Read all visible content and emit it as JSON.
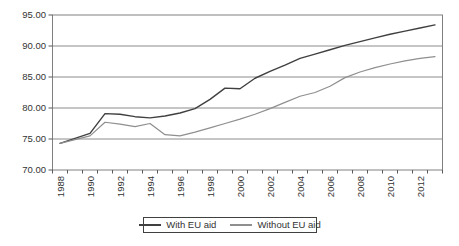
{
  "chart_data": {
    "type": "line",
    "title": "",
    "xlabel": "",
    "ylabel": "",
    "x": [
      1988,
      1989,
      1990,
      1991,
      1992,
      1993,
      1994,
      1995,
      1996,
      1997,
      1998,
      1999,
      2000,
      2001,
      2002,
      2003,
      2004,
      2005,
      2006,
      2007,
      2008,
      2009,
      2010,
      2011,
      2012,
      2013
    ],
    "series": [
      {
        "name": "With EU aid",
        "color": "#404040",
        "stroke_width": 1.4,
        "values": [
          74.3,
          75.1,
          75.9,
          79.1,
          79.0,
          78.6,
          78.4,
          78.7,
          79.2,
          79.9,
          81.4,
          83.2,
          83.1,
          84.8,
          85.9,
          86.9,
          88.0,
          88.7,
          89.4,
          90.1,
          90.7,
          91.3,
          91.9,
          92.4,
          92.9,
          93.4
        ]
      },
      {
        "name": "Without EU aid",
        "color": "#8f8f8f",
        "stroke_width": 1.2,
        "values": [
          74.3,
          74.9,
          75.5,
          77.7,
          77.4,
          77.0,
          77.5,
          75.7,
          75.5,
          76.1,
          76.8,
          77.5,
          78.2,
          79.0,
          79.9,
          80.9,
          81.9,
          82.5,
          83.5,
          84.9,
          85.8,
          86.5,
          87.1,
          87.6,
          88.0,
          88.3
        ]
      }
    ],
    "ylim": [
      70,
      95
    ],
    "yticks": [
      70,
      75,
      80,
      85,
      90,
      95
    ],
    "ytick_labels": [
      "70.00",
      "75.00",
      "80.00",
      "85.00",
      "90.00",
      "95.00"
    ],
    "xtick_labeled_years": [
      1988,
      1990,
      1992,
      1994,
      1996,
      1998,
      2000,
      2002,
      2004,
      2006,
      2008,
      2010,
      2012
    ],
    "x_label_rotation": -90,
    "grid": "horizontal",
    "legend_position": "bottom"
  },
  "colors": {
    "grid": "#808080",
    "plot_border": "#808080",
    "tick": "#595959",
    "text": "#333333",
    "background": "#ffffff",
    "legend_border": "#404040"
  }
}
